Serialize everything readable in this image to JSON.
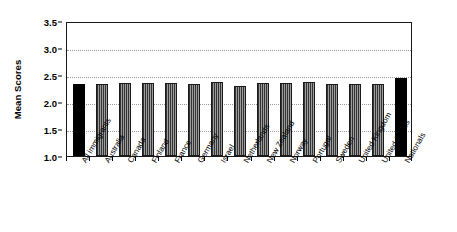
{
  "chart_data": {
    "type": "bar",
    "title": "",
    "subtitle": "",
    "xlabel": "",
    "ylabel": "Mean Scores",
    "ylim": [
      1.0,
      3.5
    ],
    "ytick_labels": [
      "1.0",
      "1.5",
      "2.0",
      "2.5",
      "3.0",
      "3.5"
    ],
    "ytick_values": [
      1.0,
      1.5,
      2.0,
      2.5,
      3.0,
      3.5
    ],
    "grid": "horizontal-dotted",
    "legend": "none",
    "categories": [
      "All immigrants",
      "Australia",
      "Canada",
      "Finland",
      "France",
      "Germany",
      "Israel",
      "Netherlands",
      "New Zealand",
      "Norway",
      "Portugal",
      "Sweden",
      "United Kingdom",
      "United States",
      "Nationals"
    ],
    "values": [
      2.33,
      2.33,
      2.36,
      2.35,
      2.35,
      2.34,
      2.37,
      2.3,
      2.35,
      2.36,
      2.37,
      2.34,
      2.33,
      2.33,
      2.45
    ],
    "bar_styles": [
      "black",
      "hatch",
      "hatch",
      "hatch",
      "hatch",
      "hatch",
      "hatch",
      "hatch",
      "hatch",
      "hatch",
      "hatch",
      "hatch",
      "hatch",
      "hatch",
      "black"
    ],
    "colors": {
      "black_bar": "#000000",
      "hatched_bar": "#737373",
      "gridline": "#9a9a9a",
      "frame": "#1a1a1a",
      "background": "#ffffff"
    }
  }
}
